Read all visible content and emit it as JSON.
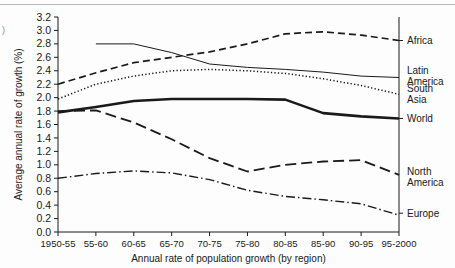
{
  "figure": {
    "name": "population-growth-by-region-chart"
  },
  "axes": {
    "y_title": "Average annual rate of growth (%)",
    "x_title": "Annual rate of population growth (by region)",
    "y_ticks": [
      "0.0",
      "0.2",
      "0.4",
      "0.6",
      "0.8",
      "1.0",
      "1.2",
      "1.4",
      "1.6",
      "1.8",
      "2.0",
      "2.2",
      "2.4",
      "2.6",
      "2.8",
      "3.0",
      "3.2"
    ],
    "x_ticks": [
      "1950-55",
      "55-60",
      "60-65",
      "65-70",
      "70-75",
      "75-80",
      "80-85",
      "85-90",
      "90-95",
      "95-2000"
    ]
  },
  "legend": {
    "items": [
      {
        "label": "Africa",
        "style": "dashed"
      },
      {
        "label": "Latin\nAmerica",
        "line1": "Latin",
        "line2": "America",
        "style": "thin-solid"
      },
      {
        "label": "South\nAsia",
        "line1": "South",
        "line2": "Asia",
        "style": "dotted"
      },
      {
        "label": "World",
        "style": "thick-solid"
      },
      {
        "label": "North\nAmerica",
        "line1": "North",
        "line2": "America",
        "style": "long-dash"
      },
      {
        "label": "Europe",
        "style": "dash-dot"
      }
    ]
  },
  "chart_data": {
    "type": "line",
    "title": "",
    "xlabel": "Annual rate of population growth (by region)",
    "ylabel": "Average annual rate of growth (%)",
    "ylim": [
      0.0,
      3.2
    ],
    "grid": false,
    "legend_position": "right",
    "categories": [
      "1950-55",
      "55-60",
      "60-65",
      "65-70",
      "70-75",
      "75-80",
      "80-85",
      "85-90",
      "90-95",
      "95-2000"
    ],
    "series": [
      {
        "name": "Africa",
        "style": "dashed",
        "values": [
          2.2,
          2.37,
          2.52,
          2.6,
          2.68,
          2.8,
          2.95,
          2.98,
          2.93,
          2.85
        ]
      },
      {
        "name": "Latin America",
        "style": "thin-solid",
        "values": [
          null,
          2.8,
          2.8,
          2.67,
          2.5,
          2.45,
          2.42,
          2.38,
          2.32,
          2.3
        ]
      },
      {
        "name": "South Asia",
        "style": "dotted",
        "values": [
          1.98,
          2.2,
          2.32,
          2.4,
          2.42,
          2.4,
          2.36,
          2.28,
          2.18,
          2.05
        ]
      },
      {
        "name": "World",
        "style": "thick-solid",
        "values": [
          1.78,
          1.86,
          1.95,
          1.98,
          1.98,
          1.98,
          1.97,
          1.77,
          1.72,
          1.69
        ]
      },
      {
        "name": "North America",
        "style": "long-dash",
        "values": [
          1.8,
          1.81,
          1.63,
          1.38,
          1.1,
          0.9,
          1.0,
          1.05,
          1.07,
          0.85
        ]
      },
      {
        "name": "Europe",
        "style": "dash-dot",
        "values": [
          0.8,
          0.87,
          0.91,
          0.88,
          0.78,
          0.62,
          0.53,
          0.48,
          0.42,
          0.25
        ]
      }
    ]
  }
}
